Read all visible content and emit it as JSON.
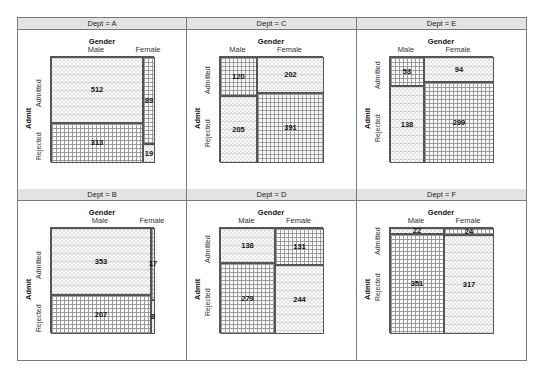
{
  "chart_data": {
    "type": "mosaic",
    "title": "",
    "facet_variable": "Dept",
    "column_variable": "Gender",
    "row_variable": "Admit",
    "column_levels": [
      "Male",
      "Female"
    ],
    "row_levels": [
      "Admitted",
      "Rejected"
    ],
    "panels": [
      {
        "dept": "A",
        "label": "Dept = A",
        "counts": {
          "Male": {
            "Admitted": 512,
            "Rejected": 313
          },
          "Female": {
            "Admitted": 89,
            "Rejected": 19
          }
        },
        "shading": {
          "Male": {
            "Admitted": "circles",
            "Rejected": "grid"
          },
          "Female": {
            "Admitted": "grid",
            "Rejected": "circles"
          }
        }
      },
      {
        "dept": "C",
        "label": "Dept = C",
        "counts": {
          "Male": {
            "Admitted": 120,
            "Rejected": 205
          },
          "Female": {
            "Admitted": 202,
            "Rejected": 391
          }
        },
        "shading": {
          "Male": {
            "Admitted": "grid",
            "Rejected": "circles"
          },
          "Female": {
            "Admitted": "circles",
            "Rejected": "grid"
          }
        }
      },
      {
        "dept": "E",
        "label": "Dept = E",
        "counts": {
          "Male": {
            "Admitted": 53,
            "Rejected": 138
          },
          "Female": {
            "Admitted": 94,
            "Rejected": 299
          }
        },
        "shading": {
          "Male": {
            "Admitted": "grid",
            "Rejected": "circles"
          },
          "Female": {
            "Admitted": "circles",
            "Rejected": "grid"
          }
        }
      },
      {
        "dept": "B",
        "label": "Dept = B",
        "counts": {
          "Male": {
            "Admitted": 353,
            "Rejected": 207
          },
          "Female": {
            "Admitted": 17,
            "Rejected": 8
          }
        },
        "shading": {
          "Male": {
            "Admitted": "circles",
            "Rejected": "grid"
          },
          "Female": {
            "Admitted": "grid",
            "Rejected": "circles"
          }
        }
      },
      {
        "dept": "D",
        "label": "Dept = D",
        "counts": {
          "Male": {
            "Admitted": 138,
            "Rejected": 279
          },
          "Female": {
            "Admitted": 131,
            "Rejected": 244
          }
        },
        "shading": {
          "Male": {
            "Admitted": "circles",
            "Rejected": "grid"
          },
          "Female": {
            "Admitted": "grid",
            "Rejected": "circles"
          }
        }
      },
      {
        "dept": "F",
        "label": "Dept = F",
        "counts": {
          "Male": {
            "Admitted": 22,
            "Rejected": 351
          },
          "Female": {
            "Admitted": 24,
            "Rejected": 317
          }
        },
        "shading": {
          "Male": {
            "Admitted": "circles",
            "Rejected": "grid"
          },
          "Female": {
            "Admitted": "grid",
            "Rejected": "circles"
          }
        }
      }
    ],
    "layout": {
      "rows": 2,
      "cols": 3,
      "order": [
        "A",
        "C",
        "E",
        "B",
        "D",
        "F"
      ]
    }
  },
  "labels": {
    "gender_title": "Gender",
    "male": "Male",
    "female": "Female",
    "admit_title": "Admit",
    "admitted": "Admitted",
    "rejected": "Rejected"
  }
}
